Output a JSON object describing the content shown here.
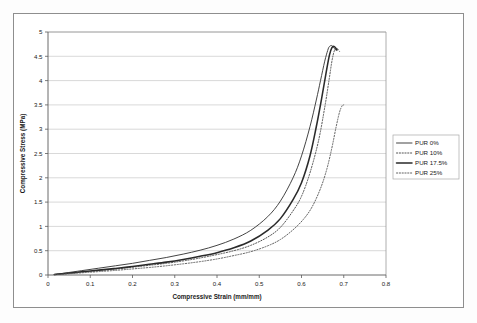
{
  "chart_data": {
    "type": "line",
    "title": "",
    "xlabel": "Compressive Strain (mm/mm)",
    "ylabel": "Compressive Stress (MPa)",
    "xlim": [
      0,
      0.8
    ],
    "ylim": [
      0,
      5
    ],
    "xticks": [
      "0",
      "0.1",
      "0.2",
      "0.3",
      "0.4",
      "0.5",
      "0.6",
      "0.7",
      "0.8"
    ],
    "xtick_values": [
      0,
      0.1,
      0.2,
      0.3,
      0.4,
      0.5,
      0.6,
      0.7,
      0.8
    ],
    "yticks": [
      "0",
      "0.5",
      "1",
      "1.5",
      "2",
      "2.5",
      "3",
      "3.5",
      "4",
      "4.5",
      "5"
    ],
    "ytick_values": [
      0,
      0.5,
      1,
      1.5,
      2,
      2.5,
      3,
      3.5,
      4,
      4.5,
      5
    ],
    "grid": "horizontal",
    "legend_position": "right",
    "series": [
      {
        "name": "PUR 0%",
        "style": "solid-thin",
        "color": "#3a3a3a",
        "x": [
          0.015,
          0.04,
          0.08,
          0.12,
          0.16,
          0.2,
          0.24,
          0.28,
          0.32,
          0.36,
          0.4,
          0.44,
          0.48,
          0.52,
          0.55,
          0.58,
          0.6,
          0.62,
          0.635,
          0.645,
          0.655,
          0.662,
          0.666,
          0.672,
          0.678,
          0.682
        ],
        "y": [
          0.01,
          0.04,
          0.09,
          0.14,
          0.19,
          0.24,
          0.3,
          0.36,
          0.43,
          0.51,
          0.61,
          0.74,
          0.92,
          1.2,
          1.52,
          2.0,
          2.45,
          3.05,
          3.6,
          4.0,
          4.4,
          4.62,
          4.7,
          4.72,
          4.66,
          4.62
        ]
      },
      {
        "name": "PUR 10%",
        "style": "dotted",
        "color": "#4a4a4a",
        "x": [
          0.015,
          0.04,
          0.08,
          0.12,
          0.16,
          0.2,
          0.24,
          0.28,
          0.32,
          0.36,
          0.4,
          0.44,
          0.48,
          0.52,
          0.55,
          0.58,
          0.6,
          0.62,
          0.64,
          0.655,
          0.665,
          0.672,
          0.678,
          0.684,
          0.69
        ],
        "y": [
          0.01,
          0.03,
          0.06,
          0.09,
          0.12,
          0.16,
          0.2,
          0.24,
          0.29,
          0.35,
          0.42,
          0.5,
          0.61,
          0.78,
          0.98,
          1.32,
          1.62,
          2.1,
          2.75,
          3.45,
          4.0,
          4.4,
          4.62,
          4.66,
          4.6
        ]
      },
      {
        "name": "PUR 17.5%",
        "style": "solid-thick",
        "color": "#2a2a2a",
        "x": [
          0.015,
          0.04,
          0.08,
          0.12,
          0.16,
          0.2,
          0.24,
          0.28,
          0.32,
          0.36,
          0.4,
          0.44,
          0.48,
          0.52,
          0.55,
          0.58,
          0.6,
          0.62,
          0.635,
          0.648,
          0.658,
          0.666,
          0.672,
          0.678,
          0.684
        ],
        "y": [
          0.01,
          0.03,
          0.065,
          0.1,
          0.135,
          0.175,
          0.22,
          0.265,
          0.32,
          0.385,
          0.46,
          0.56,
          0.7,
          0.92,
          1.16,
          1.55,
          1.9,
          2.45,
          3.05,
          3.65,
          4.15,
          4.52,
          4.68,
          4.7,
          4.63
        ]
      },
      {
        "name": "PUR 25%",
        "style": "dotted",
        "color": "#5a5a5a",
        "x": [
          0.015,
          0.04,
          0.08,
          0.12,
          0.16,
          0.2,
          0.24,
          0.28,
          0.32,
          0.36,
          0.4,
          0.44,
          0.48,
          0.52,
          0.55,
          0.58,
          0.605,
          0.625,
          0.645,
          0.66,
          0.672,
          0.682,
          0.69,
          0.696,
          0.7
        ],
        "y": [
          0.005,
          0.02,
          0.045,
          0.07,
          0.095,
          0.125,
          0.155,
          0.19,
          0.23,
          0.275,
          0.33,
          0.4,
          0.48,
          0.6,
          0.73,
          0.93,
          1.15,
          1.4,
          1.78,
          2.18,
          2.62,
          3.05,
          3.35,
          3.48,
          3.5
        ]
      }
    ]
  },
  "legend": {
    "entries": [
      {
        "label": "PUR 0%"
      },
      {
        "label": "PUR 10%"
      },
      {
        "label": "PUR 17.5%"
      },
      {
        "label": "PUR 25%"
      }
    ]
  }
}
